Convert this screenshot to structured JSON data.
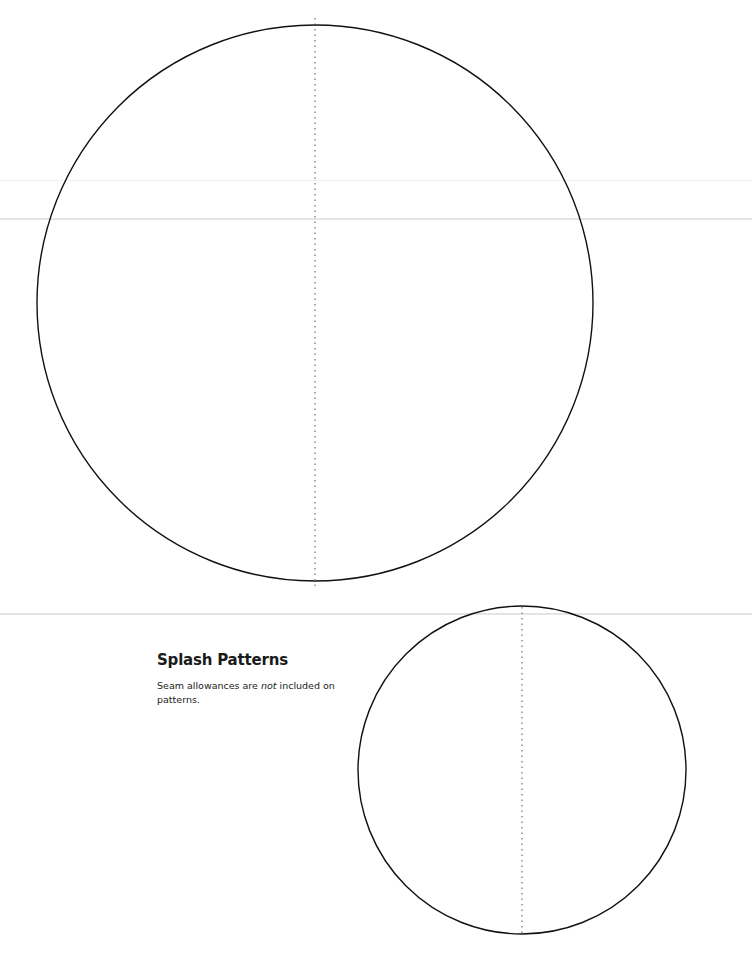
{
  "document": {
    "title": "Splash Patterns",
    "note_before": "Seam allowances are ",
    "note_emphasis": "not",
    "note_after": " included on patterns."
  },
  "patterns": [
    {
      "name": "large-circle",
      "cx": 315,
      "cy": 303,
      "r": 278,
      "grainline": "dotted-vertical"
    },
    {
      "name": "small-circle",
      "cx": 522,
      "cy": 770,
      "r": 164,
      "grainline": "dotted-vertical"
    }
  ],
  "colors": {
    "outline": "#111111",
    "grainline": "#555555",
    "fold": "#e4e4e4"
  }
}
